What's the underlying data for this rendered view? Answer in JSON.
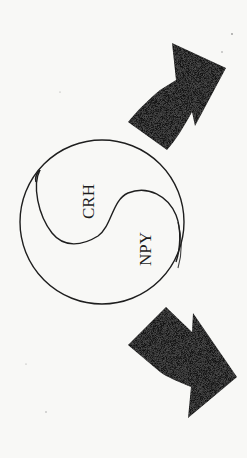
{
  "diagram": {
    "type": "yin-yang cycle",
    "orientation": "rotated 90deg counter-clockwise",
    "regions": [
      {
        "id": "upper",
        "label": "CRH"
      },
      {
        "id": "lower",
        "label": "NPY"
      }
    ],
    "arrows": [
      {
        "id": "arrow-top",
        "direction": "up-right",
        "position": "above circle"
      },
      {
        "id": "arrow-bottom",
        "direction": "down-right",
        "position": "below circle"
      }
    ],
    "colors": {
      "background": "#f8f8f6",
      "stroke": "#1e1e1e",
      "arrow_fill": "#141414"
    }
  }
}
